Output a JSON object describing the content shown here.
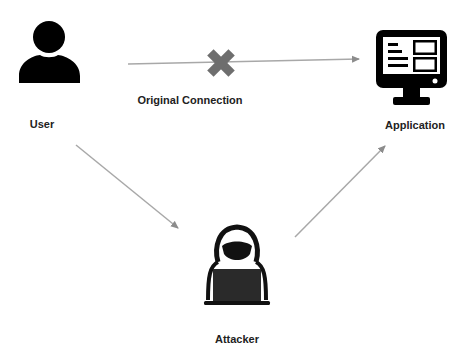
{
  "diagram": {
    "type": "man-in-the-middle",
    "nodes": [
      {
        "id": "user",
        "label": "User",
        "icon": "user-icon"
      },
      {
        "id": "application",
        "label": "Application",
        "icon": "monitor-icon"
      },
      {
        "id": "attacker",
        "label": "Attacker",
        "icon": "hacker-icon"
      }
    ],
    "edges": [
      {
        "from": "user",
        "to": "application",
        "label": "Original Connection",
        "blocked": true,
        "marker": "x-icon"
      },
      {
        "from": "user",
        "to": "attacker",
        "label": ""
      },
      {
        "from": "attacker",
        "to": "application",
        "label": ""
      }
    ],
    "colors": {
      "icon": "#000000",
      "arrow": "#a0a0a0",
      "cross": "#6e6e6e",
      "text": "#222222",
      "background": "#ffffff"
    }
  },
  "labels": {
    "user": "User",
    "application": "Application",
    "attacker": "Attacker",
    "original_connection": "Original Connection"
  }
}
